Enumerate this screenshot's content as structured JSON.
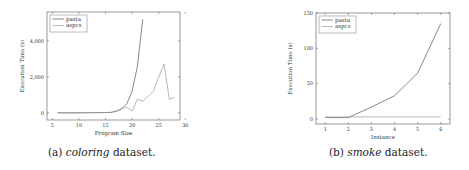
{
  "figures": [
    {
      "caption": {
        "label": "(a)",
        "name": "coloring",
        "suffix": "dataset."
      },
      "xlabel": "Program Size",
      "ylabel": "Execution Time (s)",
      "legend": [
        "pasta",
        "aspcs"
      ]
    },
    {
      "caption": {
        "label": "(b)",
        "name": "smoke",
        "suffix": "dataset."
      },
      "xlabel": "Instance",
      "ylabel": "Execution Time (s)",
      "legend": [
        "pasta",
        "aspcs"
      ]
    }
  ],
  "chart_data": [
    {
      "type": "line",
      "title": "(a) coloring dataset.",
      "xlabel": "Program Size",
      "ylabel": "Execution Time (s)",
      "xlim": [
        4,
        29
      ],
      "ylim": [
        -400,
        5600
      ],
      "xticks": [
        5,
        10,
        15,
        20,
        25,
        30
      ],
      "yticks": [
        0,
        2000,
        4000
      ],
      "ytick_labels": [
        "0",
        "2,000",
        "4,000"
      ],
      "grid": false,
      "legend_position": "upper left",
      "series": [
        {
          "name": "pasta",
          "color": "#555555",
          "x": [
            6,
            8,
            10,
            12,
            14,
            16,
            17,
            18,
            19,
            20,
            21,
            22
          ],
          "y": [
            0,
            0,
            0,
            5,
            10,
            20,
            80,
            200,
            500,
            1200,
            2600,
            5200
          ]
        },
        {
          "name": "aspcs",
          "color": "#999999",
          "x": [
            6,
            8,
            10,
            12,
            14,
            16,
            17,
            18,
            19,
            20,
            21,
            22,
            23,
            24,
            25,
            26,
            27,
            28
          ],
          "y": [
            0,
            0,
            0,
            5,
            10,
            20,
            100,
            250,
            300,
            100,
            750,
            650,
            900,
            1200,
            2000,
            2700,
            750,
            850
          ]
        }
      ]
    },
    {
      "type": "line",
      "title": "(b) smoke dataset.",
      "xlabel": "Instance",
      "ylabel": "Execution Time (s)",
      "xlim": [
        0.6,
        6.4
      ],
      "ylim": [
        -7,
        150
      ],
      "xticks": [
        1,
        2,
        3,
        4,
        5,
        6
      ],
      "yticks": [
        0,
        50,
        100,
        150
      ],
      "grid": false,
      "legend_position": "upper left",
      "series": [
        {
          "name": "pasta",
          "color": "#555555",
          "x": [
            1,
            2,
            3,
            4,
            5,
            6
          ],
          "y": [
            2,
            2,
            17,
            33,
            65,
            135
          ]
        },
        {
          "name": "aspcs",
          "color": "#999999",
          "x": [
            1,
            2,
            3,
            4,
            5,
            6
          ],
          "y": [
            3,
            3,
            3,
            3,
            3,
            3
          ]
        }
      ]
    }
  ]
}
